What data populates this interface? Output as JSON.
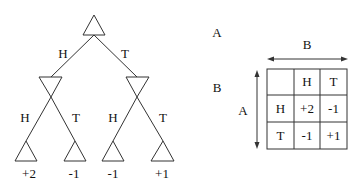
{
  "game_tree": {
    "root": {
      "player": "A"
    },
    "edges_level1": [
      {
        "label": "H"
      },
      {
        "label": "T"
      }
    ],
    "level2": [
      {
        "player": "B",
        "edges": [
          {
            "label": "H"
          },
          {
            "label": "T"
          }
        ]
      },
      {
        "player": "B",
        "edges": [
          {
            "label": "H"
          },
          {
            "label": "T"
          }
        ]
      }
    ],
    "leaves": [
      {
        "payoff": "+2"
      },
      {
        "payoff": "-1"
      },
      {
        "payoff": "-1"
      },
      {
        "payoff": "+1"
      }
    ]
  },
  "side_labels": {
    "top": "A",
    "middle": "B"
  },
  "payoff_matrix": {
    "column_player": "B",
    "row_player": "A",
    "corner": "",
    "column_headers": [
      "H",
      "T"
    ],
    "rows": [
      {
        "header": "H",
        "values": [
          "+2",
          "-1"
        ]
      },
      {
        "header": "T",
        "values": [
          "-1",
          "+1"
        ]
      }
    ]
  },
  "colors": {
    "stroke": "#333333",
    "text": "#111111",
    "background": "#ffffff"
  }
}
